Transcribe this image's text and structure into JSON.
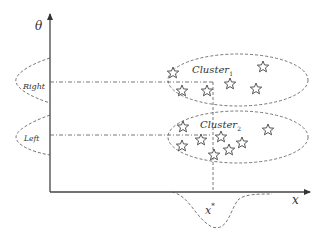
{
  "diagram": {
    "axes": {
      "y_label": "θ",
      "x_label": "x"
    },
    "lobes": {
      "upper": "Right",
      "lower": "Left"
    },
    "clusters": [
      {
        "name": "Cluster",
        "subscript": "1",
        "star_count": 6
      },
      {
        "name": "Cluster",
        "subscript": "2",
        "star_count": 8
      }
    ],
    "marker": {
      "label": "x",
      "superscript": "*"
    }
  }
}
